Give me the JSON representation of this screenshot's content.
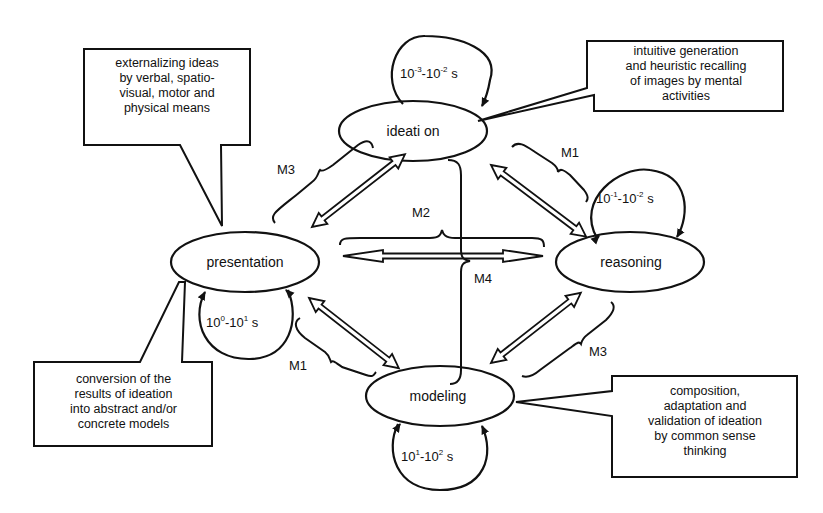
{
  "diagram": {
    "nodes": {
      "ideation": {
        "label": "ideati on"
      },
      "presentation": {
        "label": "presentation"
      },
      "reasoning": {
        "label": "reasoning"
      },
      "modeling": {
        "label": "modeling"
      }
    },
    "time_scales": {
      "ideation": {
        "a_base": "10",
        "a_exp": "-3",
        "sep": "-",
        "b_base": "10",
        "b_exp": "-2",
        "unit": " s"
      },
      "reasoning": {
        "a_base": "10",
        "a_exp": "-1",
        "sep": "-",
        "b_base": "10",
        "b_exp": "-2",
        "unit": " s"
      },
      "presentation": {
        "a_base": "10",
        "a_exp": "0",
        "sep": "-",
        "b_base": "10",
        "b_exp": "1",
        "unit": " s"
      },
      "modeling": {
        "a_base": "10",
        "a_exp": "1",
        "sep": "-",
        "b_base": "10",
        "b_exp": "2",
        "unit": " s"
      }
    },
    "links": {
      "presentation_ideation": "M3",
      "ideation_reasoning": "M1",
      "presentation_reasoning": "M2",
      "ideation_modeling": "M4",
      "presentation_modeling": "M1",
      "reasoning_modeling": "M3"
    },
    "callouts": {
      "ideation": [
        "intuitive generation",
        "and heuristic recalling",
        "of images by mental",
        "activities"
      ],
      "presentation_top": [
        "externalizing ideas",
        "by verbal, spatio-",
        "visual, motor and",
        "physical means"
      ],
      "presentation_bottom": [
        "conversion of the",
        "results of ideation",
        "into abstract and/or",
        "concrete models"
      ],
      "modeling": [
        "composition,",
        "adaptation and",
        "validation of ideation",
        "by common sense",
        "thinking"
      ]
    }
  }
}
